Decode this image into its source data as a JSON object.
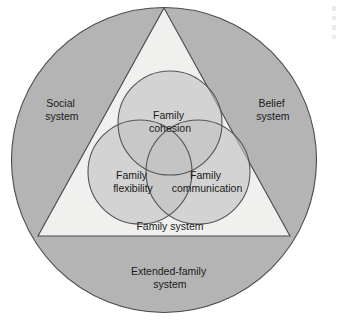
{
  "diagram": {
    "type": "venn-in-triangle-in-circle",
    "canvas": {
      "width": 343,
      "height": 331,
      "background": "#ffffff"
    },
    "colors": {
      "outer_ring_fill": "#b4b4b4",
      "triangle_fill": "#f0f0ef",
      "venn_circle_fill": "#c2c2c2",
      "outline": "#4a4a4a",
      "text": "#1a1a1a"
    },
    "outer_ring": {
      "shape": "circle",
      "center_x": 164,
      "center_y": 160,
      "radius": 153,
      "labels": [
        {
          "id": "social-system",
          "text_line_1": "Social",
          "text_line_2": "system",
          "x": 62,
          "y": 104
        },
        {
          "id": "belief-system",
          "text_line_1": "Belief",
          "text_line_2": "system",
          "x": 273,
          "y": 104
        },
        {
          "id": "extended-family-system",
          "text_line_1": "Extended-family",
          "text_line_2": "system",
          "x": 170,
          "y": 272
        }
      ]
    },
    "triangle": {
      "shape": "triangle",
      "apex_x": 164,
      "apex_y": 8,
      "base_left_x": 38,
      "base_right_x": 290,
      "base_y": 236,
      "label": {
        "id": "family-system",
        "text": "Family system",
        "x": 170,
        "y": 227
      }
    },
    "venn": {
      "radius": 52,
      "circles": [
        {
          "id": "family-cohesion",
          "text_line_1": "Family",
          "text_line_2": "cohesion",
          "cx": 170,
          "cy": 123,
          "label_x": 170,
          "label_y": 116
        },
        {
          "id": "family-flexibility",
          "text_line_1": "Family",
          "text_line_2": "flexibility",
          "cx": 140,
          "cy": 172,
          "label_x": 133,
          "label_y": 176
        },
        {
          "id": "family-communication",
          "text_line_1": "Family",
          "text_line_2": "communication",
          "cx": 198,
          "cy": 172,
          "label_x": 207,
          "label_y": 176
        }
      ]
    }
  }
}
